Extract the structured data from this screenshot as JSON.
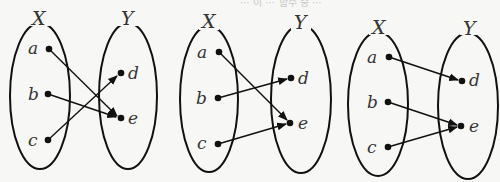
{
  "top_strip_text": "⋯ 이 ⋯ 함수 중 ⋯",
  "panels": [
    {
      "set_x_label": "X",
      "set_y_label": "Y",
      "domain_elements": [
        "a",
        "b",
        "c"
      ],
      "codomain_elements": [
        "d",
        "e"
      ],
      "mappings": [
        [
          "a",
          "e"
        ],
        [
          "b",
          "e"
        ],
        [
          "c",
          "d"
        ]
      ]
    },
    {
      "set_x_label": "X",
      "set_y_label": "Y",
      "domain_elements": [
        "a",
        "b",
        "c"
      ],
      "codomain_elements": [
        "d",
        "e"
      ],
      "mappings": [
        [
          "a",
          "e"
        ],
        [
          "b",
          "d"
        ],
        [
          "c",
          "e"
        ]
      ]
    },
    {
      "set_x_label": "X",
      "set_y_label": "Y",
      "domain_elements": [
        "a",
        "b",
        "c"
      ],
      "codomain_elements": [
        "d",
        "e"
      ],
      "mappings": [
        [
          "a",
          "d"
        ],
        [
          "b",
          "e"
        ],
        [
          "c",
          "e"
        ]
      ]
    }
  ],
  "colors": {
    "stroke": "#111111",
    "text": "#333333",
    "background": "#f7f7f5"
  }
}
